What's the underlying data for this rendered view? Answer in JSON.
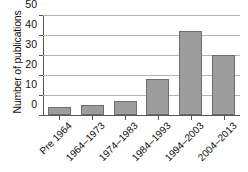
{
  "chart_data": {
    "type": "bar",
    "title": "",
    "xlabel": "",
    "ylabel": "Number of publications",
    "categories": [
      "Pre 1964",
      "1964–1973",
      "1974–1983",
      "1984–1993",
      "1994–2003",
      "2004–2013"
    ],
    "values": [
      4,
      5,
      7,
      18,
      42,
      30
    ],
    "ylim": [
      0,
      50
    ],
    "yticks": [
      0,
      10,
      20,
      30,
      40,
      50
    ],
    "ytick_labels": [
      "0",
      "10",
      "20",
      "30",
      "40",
      "50"
    ],
    "grid": true,
    "legend": false,
    "legend_position": "none",
    "bar_color": "#9d9d9d",
    "bar_edge_color": "#6d6d6d",
    "grid_color": "#b4b4b4",
    "axis_color": "#555555"
  }
}
